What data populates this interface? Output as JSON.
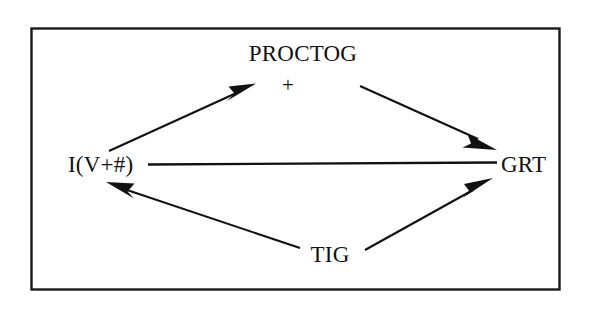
{
  "diagram": {
    "type": "causal-loop-diagram",
    "background_color": "#ffffff",
    "line_color": "#111111",
    "frame": {
      "name": "border-frame",
      "stroke_color": "#1a1a1a"
    },
    "nodes": [
      {
        "id": "proctog",
        "label": "PROCTOG",
        "position": "top-center"
      },
      {
        "id": "plus",
        "label": "+",
        "position": "below-proctog"
      },
      {
        "id": "iv",
        "label": "I(V+#)",
        "position": "left"
      },
      {
        "id": "grt",
        "label": "GRT",
        "position": "right"
      },
      {
        "id": "tig",
        "label": "TIG",
        "position": "bottom-center"
      }
    ],
    "edges": [
      {
        "id": "iv-to-proctog",
        "from": "I(V+#)",
        "to": "PROCTOG",
        "arrow": "filled-triangle",
        "direction": "up-right"
      },
      {
        "id": "proctog-to-grt",
        "from": "PROCTOG",
        "to": "GRT",
        "arrow": "filled-triangle",
        "direction": "down-right"
      },
      {
        "id": "iv-to-grt",
        "from": "I(V+#)",
        "to": "GRT",
        "arrow": "none",
        "direction": "horizontal"
      },
      {
        "id": "tig-to-iv",
        "from": "TIG",
        "to": "I(V+#)",
        "arrow": "filled-triangle",
        "direction": "up-left"
      },
      {
        "id": "tig-to-grt",
        "from": "TIG",
        "to": "GRT",
        "arrow": "filled-triangle",
        "direction": "up-right"
      }
    ]
  }
}
